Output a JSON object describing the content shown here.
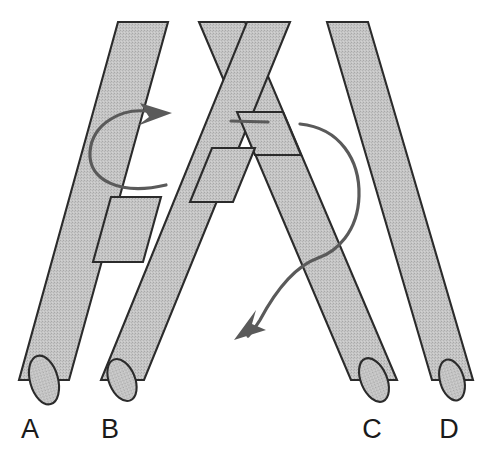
{
  "figure": {
    "background_color": "#ffffff",
    "canvas": {
      "width": 498,
      "height": 468
    }
  },
  "style": {
    "rod_fill_color": "#c2c2c2",
    "rod_outline_color": "#2b2b2b",
    "arrow_color": "#5a5a5a",
    "label_color": "#1a1a1a",
    "rod_width_px": 26
  },
  "labels": [
    {
      "id": "A",
      "text": "A",
      "x": 30,
      "y": 438
    },
    {
      "id": "B",
      "text": "B",
      "x": 110,
      "y": 438
    },
    {
      "id": "C",
      "text": "C",
      "x": 372,
      "y": 438
    },
    {
      "id": "D",
      "text": "D",
      "x": 449,
      "y": 438
    }
  ],
  "rods": [
    {
      "id": "rod-a",
      "label": "A",
      "direction": "down-left",
      "top": {
        "x": 143,
        "y": 22
      },
      "bottom": {
        "x": 44,
        "y": 380
      },
      "draw_order": 1
    },
    {
      "id": "rod-b",
      "label": "B",
      "direction": "down-left",
      "top": {
        "x": 268,
        "y": 22
      },
      "bottom": {
        "x": 122,
        "y": 380
      },
      "draw_order": 3
    },
    {
      "id": "rod-c",
      "label": "C",
      "direction": "down-right",
      "top": {
        "x": 222,
        "y": 22
      },
      "bottom": {
        "x": 374,
        "y": 380
      },
      "draw_order": 2
    },
    {
      "id": "rod-d",
      "label": "D",
      "direction": "down-right",
      "top": {
        "x": 347,
        "y": 22
      },
      "bottom": {
        "x": 452,
        "y": 380
      },
      "draw_order": 4
    }
  ],
  "arrows": [
    {
      "id": "left-loop-arrow",
      "kind": "loop",
      "description": "elliptical loop around left rod, arrowhead pointing right",
      "tip": {
        "x": 168,
        "y": 114
      },
      "tail": {
        "x": 168,
        "y": 185
      }
    },
    {
      "id": "right-sweep-arrow",
      "kind": "sweep",
      "description": "curve from center passing behind rods sweeping right then down-left, arrowhead pointing down-left",
      "start": {
        "x": 232,
        "y": 121
      },
      "tip": {
        "x": 238,
        "y": 337
      }
    }
  ]
}
